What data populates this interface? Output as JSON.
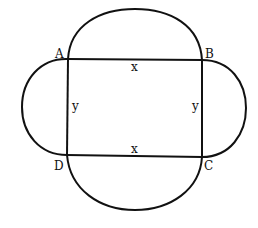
{
  "diagram": {
    "colors": {
      "stroke": "#111111",
      "background": "#ffffff"
    },
    "vertices": [
      {
        "label": "A",
        "x": 68,
        "y": 59
      },
      {
        "label": "B",
        "x": 202,
        "y": 60
      },
      {
        "label": "C",
        "x": 202,
        "y": 157
      },
      {
        "label": "D",
        "x": 67,
        "y": 155
      }
    ],
    "side_labels": {
      "top": "x",
      "bottom": "x",
      "left": "y",
      "right": "y"
    },
    "vertex_labels": {
      "a": "A",
      "b": "B",
      "c": "C",
      "d": "D"
    }
  }
}
